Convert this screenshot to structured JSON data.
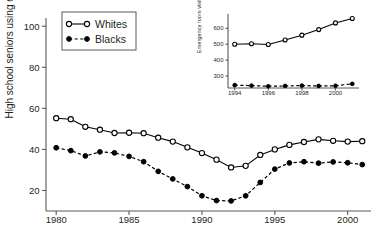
{
  "chart_data": [
    {
      "id": "main",
      "type": "line",
      "title": "",
      "xlabel": "",
      "ylabel": "High school seniors using drugs (%)",
      "xlim": [
        1979.3,
        2001.6
      ],
      "ylim": [
        10,
        104
      ],
      "xticks": [
        1980,
        1985,
        1990,
        1995,
        2000
      ],
      "xtick_labels": [
        "1980",
        "1985",
        "1990",
        "1995",
        "2000"
      ],
      "yticks": [
        20,
        40,
        60,
        80,
        100
      ],
      "ytick_labels": [
        "20",
        "40",
        "60",
        "80",
        "100"
      ],
      "grid": false,
      "legend_position": "top-left",
      "x": [
        1980,
        1981,
        1982,
        1983,
        1984,
        1985,
        1986,
        1987,
        1988,
        1989,
        1990,
        1991,
        1992,
        1993,
        1994,
        1995,
        1996,
        1997,
        1998,
        1999,
        2000,
        2001
      ],
      "series": [
        {
          "name": "Whites",
          "marker": "open-circle",
          "line_style": "solid",
          "color": "#000000",
          "values": [
            55.2,
            54.7,
            51.0,
            49.6,
            48.0,
            48.1,
            47.9,
            45.7,
            43.8,
            41.0,
            38.2,
            35.0,
            31.2,
            32.0,
            37.3,
            40.0,
            42.2,
            43.6,
            44.9,
            44.2,
            43.8,
            44.0
          ]
        },
        {
          "name": "Blacks",
          "marker": "filled-circle",
          "line_style": "dashed",
          "color": "#000000",
          "values": [
            40.8,
            39.4,
            36.8,
            38.8,
            38.3,
            36.6,
            34.0,
            29.3,
            25.6,
            21.9,
            17.4,
            15.1,
            14.9,
            17.4,
            23.9,
            30.4,
            33.4,
            34.0,
            33.3,
            33.9,
            33.5,
            32.6
          ]
        }
      ]
    },
    {
      "id": "inset",
      "type": "line",
      "title": "",
      "xlabel": "",
      "ylabel": "Emergency room visits (1000s)",
      "xlim": [
        1993.6,
        2001.4
      ],
      "ylim": [
        225,
        690
      ],
      "xticks": [
        1994,
        1996,
        1998,
        2000
      ],
      "xtick_labels": [
        "1994",
        "1996",
        "1998",
        "2000"
      ],
      "yticks": [
        300,
        400,
        500,
        600
      ],
      "ytick_labels": [
        "300",
        "400",
        "500",
        "600"
      ],
      "grid": false,
      "legend_position": "none",
      "x": [
        1994,
        1995,
        1996,
        1997,
        1998,
        1999,
        2000,
        2001
      ],
      "series": [
        {
          "name": "Whites",
          "marker": "open-circle",
          "line_style": "solid",
          "color": "#000000",
          "values": [
            500,
            503,
            498,
            527,
            557,
            592,
            634,
            662
          ]
        },
        {
          "name": "Blacks",
          "marker": "filled-circle",
          "line_style": "dashed",
          "color": "#000000",
          "values": [
            243,
            240,
            236,
            238,
            240,
            238,
            239,
            251
          ]
        }
      ]
    }
  ],
  "legend": {
    "items": [
      {
        "label": "Whites",
        "marker": "open-circle",
        "line_style": "solid"
      },
      {
        "label": "Blacks",
        "marker": "filled-circle",
        "line_style": "dashed"
      }
    ]
  }
}
